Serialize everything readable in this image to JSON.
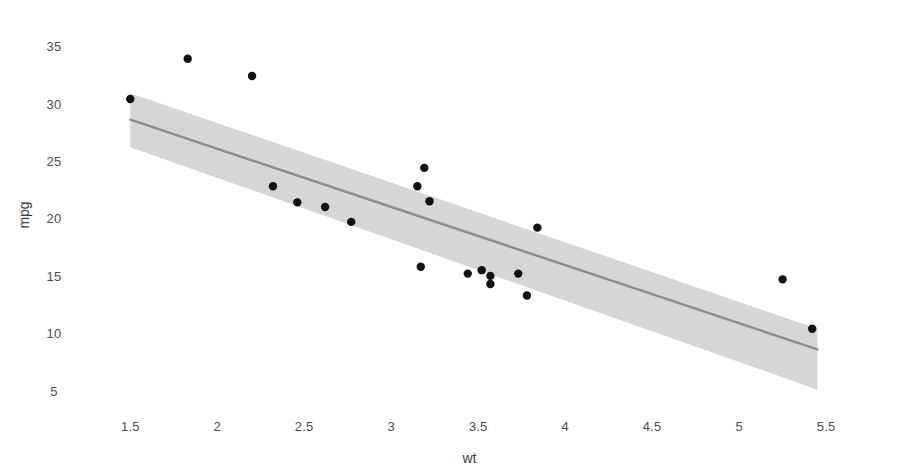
{
  "chart_data": {
    "type": "scatter",
    "title": "",
    "subtitle": "",
    "xlabel": "wt",
    "ylabel": "mpg",
    "xlim": [
      1.28,
      5.62
    ],
    "ylim": [
      4.2,
      36.4
    ],
    "xticks": [
      1.5,
      2,
      2.5,
      3,
      3.5,
      4,
      4.5,
      5,
      5.5
    ],
    "xticklabels": [
      "1.5",
      "2",
      "2.5",
      "3",
      "3.5",
      "4",
      "4.5",
      "5",
      "5.5"
    ],
    "yticks": [
      5,
      10,
      15,
      20,
      25,
      30,
      35
    ],
    "yticklabels": [
      "5",
      "10",
      "15",
      "20",
      "25",
      "30",
      "35"
    ],
    "grid": false,
    "legend": "none",
    "points": [
      {
        "x": 1.5,
        "y": 30.4
      },
      {
        "x": 1.83,
        "y": 33.9
      },
      {
        "x": 2.2,
        "y": 32.4
      },
      {
        "x": 2.32,
        "y": 22.8
      },
      {
        "x": 2.46,
        "y": 21.4
      },
      {
        "x": 2.62,
        "y": 21.0
      },
      {
        "x": 2.77,
        "y": 19.7
      },
      {
        "x": 3.15,
        "y": 22.8
      },
      {
        "x": 3.17,
        "y": 15.8
      },
      {
        "x": 3.19,
        "y": 24.4
      },
      {
        "x": 3.22,
        "y": 21.5
      },
      {
        "x": 3.44,
        "y": 15.2
      },
      {
        "x": 3.52,
        "y": 15.5
      },
      {
        "x": 3.57,
        "y": 14.3
      },
      {
        "x": 3.57,
        "y": 15.0
      },
      {
        "x": 3.73,
        "y": 15.2
      },
      {
        "x": 3.78,
        "y": 13.3
      },
      {
        "x": 3.84,
        "y": 19.2
      },
      {
        "x": 5.25,
        "y": 14.7
      },
      {
        "x": 5.42,
        "y": 10.4
      }
    ],
    "fit_line": {
      "label": "linear-regression",
      "x_start": 1.5,
      "x_end": 5.45,
      "y_start": 28.6,
      "y_end": 8.6,
      "color": "#8c8c8c"
    },
    "confidence_band": {
      "label": "confidence-interval-ribbon",
      "level": 0.95,
      "color": "#d6d6d6",
      "x_start": 1.5,
      "x_end": 5.45,
      "upper_start": 30.9,
      "upper_end": 10.4,
      "lower_start": 26.2,
      "lower_end": 5.1
    },
    "point_color": "#111111",
    "point_radius": 4.2
  }
}
